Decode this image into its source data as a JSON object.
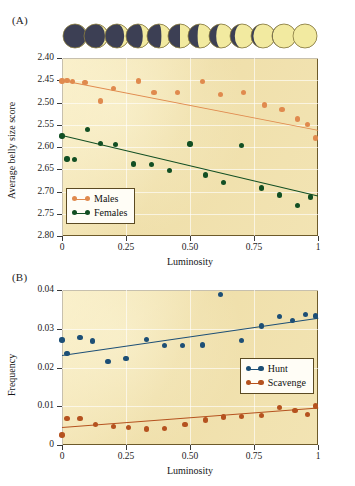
{
  "figure": {
    "panels": [
      {
        "id": "A",
        "label": "(A)"
      },
      {
        "id": "B",
        "label": "(B)"
      }
    ]
  },
  "moon_phases": {
    "name": "lunar-phase-strip",
    "count": 12,
    "dark_color": "#3c3f54",
    "light_color": "#f2eaa0",
    "illuminated_fractions": [
      0.04,
      0.12,
      0.2,
      0.3,
      0.4,
      0.5,
      0.6,
      0.7,
      0.8,
      0.9,
      0.97,
      1.0
    ]
  },
  "chart_data": [
    {
      "type": "scatter",
      "panel": "A",
      "title": "",
      "xlabel": "Luminosity",
      "ylabel": "Average belly size score",
      "xlim": [
        0,
        1
      ],
      "ylim": [
        2.4,
        2.8
      ],
      "y_inverted": true,
      "xticks": [
        0,
        0.25,
        0.5,
        0.75,
        1
      ],
      "xticklabels": [
        "0",
        "0.25",
        "0.50",
        "0.75",
        "1"
      ],
      "yticks": [
        2.4,
        2.45,
        2.5,
        2.55,
        2.6,
        2.65,
        2.7,
        2.75,
        2.8
      ],
      "yticklabels": [
        "2.40",
        "2.45",
        "2.50",
        "2.55",
        "2.60",
        "2.65",
        "2.70",
        "2.75",
        "2.80"
      ],
      "grid": true,
      "legend_position": "bottom-left",
      "plot_bgcolor": "#f0e0ac",
      "series": [
        {
          "name": "Males",
          "color": "#e08a4e",
          "x": [
            0.0,
            0.02,
            0.04,
            0.09,
            0.15,
            0.2,
            0.3,
            0.36,
            0.45,
            0.55,
            0.62,
            0.71,
            0.79,
            0.86,
            0.92,
            0.96,
            0.99
          ],
          "y": [
            2.452,
            2.451,
            2.453,
            2.455,
            2.497,
            2.468,
            2.452,
            2.477,
            2.478,
            2.453,
            2.482,
            2.478,
            2.506,
            2.516,
            2.537,
            2.549,
            2.58
          ],
          "fit": {
            "x0": 0.0,
            "y0": 2.449,
            "x1": 1.0,
            "y1": 2.561
          }
        },
        {
          "name": "Females",
          "color": "#124f23",
          "x": [
            0.0,
            0.02,
            0.05,
            0.1,
            0.15,
            0.21,
            0.28,
            0.35,
            0.42,
            0.5,
            0.56,
            0.63,
            0.7,
            0.78,
            0.85,
            0.92,
            0.97
          ],
          "y": [
            2.575,
            2.627,
            2.628,
            2.56,
            2.592,
            2.594,
            2.638,
            2.64,
            2.653,
            2.593,
            2.663,
            2.68,
            2.596,
            2.692,
            2.708,
            2.731,
            2.712
          ],
          "fit": {
            "x0": 0.0,
            "y0": 2.572,
            "x1": 1.0,
            "y1": 2.708
          }
        }
      ]
    },
    {
      "type": "scatter",
      "panel": "B",
      "title": "",
      "xlabel": "Luminosity",
      "ylabel": "Frequency",
      "xlim": [
        0,
        1
      ],
      "ylim": [
        0,
        0.04
      ],
      "y_inverted": false,
      "xticks": [
        0,
        0.25,
        0.5,
        0.75,
        1
      ],
      "xticklabels": [
        "0",
        "0.25",
        "0.50",
        "0.75",
        "1"
      ],
      "yticks": [
        0,
        0.01,
        0.02,
        0.03,
        0.04
      ],
      "yticklabels": [
        "0",
        "0.01",
        "0.02",
        "0.03",
        "0.04"
      ],
      "grid": true,
      "legend_position": "middle-right",
      "plot_bgcolor": "#f0e0ac",
      "series": [
        {
          "name": "Hunt",
          "color": "#1d4f76",
          "x": [
            0.0,
            0.02,
            0.07,
            0.12,
            0.18,
            0.25,
            0.33,
            0.4,
            0.47,
            0.55,
            0.62,
            0.7,
            0.78,
            0.85,
            0.9,
            0.95,
            0.99
          ],
          "y": [
            0.0271,
            0.0236,
            0.0277,
            0.0268,
            0.0216,
            0.0224,
            0.0272,
            0.0257,
            0.0256,
            0.0258,
            0.0389,
            0.0269,
            0.0307,
            0.0331,
            0.0321,
            0.0336,
            0.0333
          ],
          "fit": {
            "x0": 0.0,
            "y0": 0.0232,
            "x1": 1.0,
            "y1": 0.0328
          }
        },
        {
          "name": "Scavenge",
          "color": "#b5521f",
          "x": [
            0.0,
            0.02,
            0.07,
            0.13,
            0.2,
            0.26,
            0.33,
            0.4,
            0.48,
            0.56,
            0.63,
            0.7,
            0.78,
            0.85,
            0.91,
            0.96,
            0.99
          ],
          "y": [
            0.0026,
            0.0068,
            0.0069,
            0.0053,
            0.0048,
            0.0045,
            0.0041,
            0.0043,
            0.0053,
            0.0065,
            0.0072,
            0.0074,
            0.0076,
            0.0096,
            0.0089,
            0.0079,
            0.0101
          ],
          "fit": {
            "x0": 0.0,
            "y0": 0.0046,
            "x1": 1.0,
            "y1": 0.0096
          }
        }
      ]
    }
  ]
}
